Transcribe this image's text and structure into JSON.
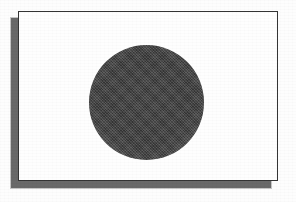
{
  "image": {
    "subject": "flag-of-japan",
    "description": "Grayscale scan of the flag of Japan: a white rectangle bordered by a thin dark rule, with a large dark dithered disc centred on the field, and a drop shadow falling down and to the left.",
    "width": 296,
    "height": 202,
    "background_color": "#fdfdfd"
  },
  "flag": {
    "name": "flag",
    "field_color": "#fefefe",
    "border_color": "#343434",
    "border_width": 1,
    "x": 18,
    "y": 11,
    "width": 260,
    "height": 170
  },
  "shadow": {
    "name": "drop-shadow",
    "color": "#5c5c5c",
    "soft_color": "#8d8d8d",
    "offset_x": -7,
    "offset_y": 7
  },
  "disc": {
    "name": "hinomaru-disc",
    "color": "#3f3f3f",
    "center_x": 145,
    "center_y": 101,
    "diameter": 115,
    "texture": "halftone-dither"
  }
}
